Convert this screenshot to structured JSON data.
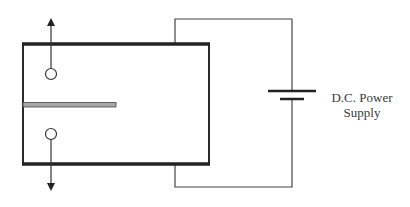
{
  "diagram": {
    "type": "circuit-schematic",
    "components": {
      "chamber": {
        "description": "Rectangular chamber with thick top and bottom electrode plates",
        "plate_color": "#222222",
        "side_color": "#2a2a2a"
      },
      "rod": {
        "description": "Horizontal gray rod inserted from left wall",
        "fill": "#a8a8a8",
        "stroke": "#444444"
      },
      "particles": [
        {
          "id": "upper-particle",
          "direction": "up"
        },
        {
          "id": "lower-particle",
          "direction": "down"
        }
      ],
      "battery": {
        "symbol": "dc-cell"
      }
    },
    "labels": {
      "power_supply_line1": "D.C. Power",
      "power_supply_line2": "Supply"
    },
    "colors": {
      "line": "#333333",
      "background": "#ffffff"
    }
  }
}
